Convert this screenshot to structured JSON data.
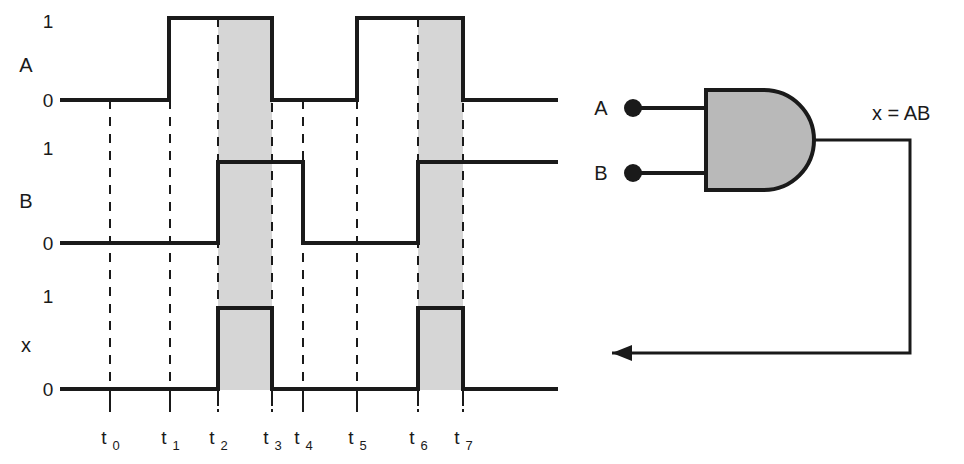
{
  "figure": {
    "type": "digital-timing-diagram-with-logic-gate",
    "background_color": "#ffffff",
    "line_color": "#1a1a1a",
    "shade_color": "#d4d4d4",
    "gate_fill_color": "#b8b8b8"
  },
  "waveforms": [
    {
      "name": "A",
      "label": "A",
      "high_label": "1",
      "low_label": "0",
      "segments": [
        0,
        0,
        1,
        1,
        0,
        0,
        1,
        1,
        0
      ]
    },
    {
      "name": "B",
      "label": "B",
      "high_label": "1",
      "low_label": "0",
      "segments": [
        0,
        0,
        0,
        1,
        1,
        0,
        0,
        1,
        1
      ]
    },
    {
      "name": "x",
      "label": "x",
      "high_label": "1",
      "low_label": "0",
      "segments": [
        0,
        0,
        0,
        1,
        0,
        0,
        0,
        1,
        0
      ]
    }
  ],
  "time_axis": {
    "ticks": [
      {
        "label": "t",
        "sub": "0"
      },
      {
        "label": "t",
        "sub": "1"
      },
      {
        "label": "t",
        "sub": "2"
      },
      {
        "label": "t",
        "sub": "3"
      },
      {
        "label": "t",
        "sub": "4"
      },
      {
        "label": "t",
        "sub": "5"
      },
      {
        "label": "t",
        "sub": "6"
      },
      {
        "label": "t",
        "sub": "7"
      }
    ]
  },
  "shaded_intervals": [
    {
      "from": "t2",
      "to": "t3"
    },
    {
      "from": "t6",
      "to": "t7"
    }
  ],
  "circuit": {
    "gate_type": "AND",
    "inputs": [
      {
        "label": "A"
      },
      {
        "label": "B"
      }
    ],
    "output": {
      "label": "x = AB"
    }
  }
}
